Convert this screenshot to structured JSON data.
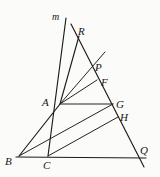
{
  "figure": {
    "width": 160,
    "height": 177,
    "background_color": "#fbfbfa",
    "stroke_color": "#1b1b1b"
  },
  "labels": {
    "m": "m",
    "R": "R",
    "P": "P",
    "F": "F",
    "A": "A",
    "G": "G",
    "H": "H",
    "B": "B",
    "C": "C",
    "Q": "Q"
  },
  "points": {
    "m_end": {
      "name": "m",
      "x": 66,
      "y": 18
    },
    "R": {
      "name": "R",
      "x": 73,
      "y": 28
    },
    "P": {
      "name": "P",
      "x": 91,
      "y": 66
    },
    "F": {
      "name": "F",
      "x": 97,
      "y": 80
    },
    "A": {
      "name": "A",
      "x": 60,
      "y": 104
    },
    "G": {
      "name": "G",
      "x": 113,
      "y": 104
    },
    "H": {
      "name": "H",
      "x": 118,
      "y": 117
    },
    "B": {
      "name": "B",
      "x": 19,
      "y": 156
    },
    "C": {
      "name": "C",
      "x": 48,
      "y": 156
    },
    "Q": {
      "name": "Q",
      "x": 140,
      "y": 157
    }
  },
  "label_positions": {
    "m": {
      "x": 52,
      "y": 12
    },
    "R": {
      "x": 78,
      "y": 26
    },
    "P": {
      "x": 95,
      "y": 62
    },
    "F": {
      "x": 101,
      "y": 77
    },
    "A": {
      "x": 42,
      "y": 97
    },
    "G": {
      "x": 116,
      "y": 99
    },
    "H": {
      "x": 120,
      "y": 112
    },
    "B": {
      "x": 5,
      "y": 156
    },
    "C": {
      "x": 43,
      "y": 160
    },
    "Q": {
      "x": 140,
      "y": 145
    }
  },
  "segments": [
    {
      "name": "line-m",
      "from": "m_end",
      "to": "C",
      "path": "M 66 18 L 48 156"
    },
    {
      "name": "line-B-A-R-extended",
      "from": "B",
      "to": "R",
      "path": "M 19 156 L 60 104 L 79 36"
    },
    {
      "name": "transversal-R-Q",
      "from": "R",
      "to": "Q",
      "path": "M 71 24 L 144 167"
    },
    {
      "name": "segment-A-P-extended",
      "from": "A",
      "to": "P",
      "path": "M 60 104 L 105 52"
    },
    {
      "name": "segment-A-F",
      "from": "A",
      "to": "F",
      "path": "M 60 104 L 97 80"
    },
    {
      "name": "segment-A-G",
      "from": "A",
      "to": "G",
      "path": "M 60 104 L 113 104"
    },
    {
      "name": "segment-B-G",
      "from": "B",
      "to": "G",
      "path": "M 19 156 L 113 104"
    },
    {
      "name": "segment-C-H",
      "from": "C",
      "to": "H",
      "path": "M 48 156 L 118 117"
    },
    {
      "name": "baseline-B-Q",
      "from": "B",
      "to": "Q",
      "path": "M 16 157 L 146 158"
    }
  ]
}
